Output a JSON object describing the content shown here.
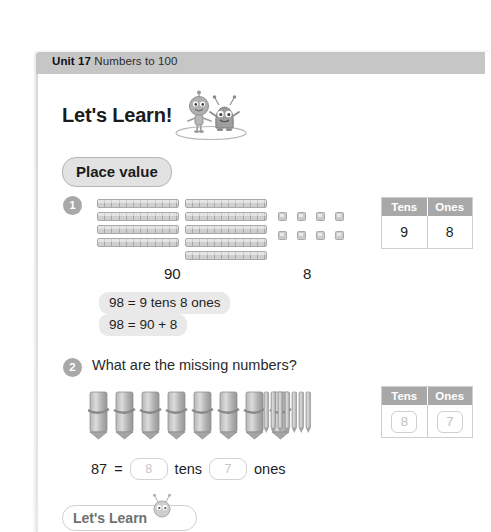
{
  "header": {
    "unit_label": "Unit 17",
    "unit_title": "Numbers to 100"
  },
  "lets_learn": {
    "title": "Let's Learn!",
    "mascot_left": "robot-character-icon",
    "mascot_right": "alien-character-icon"
  },
  "topic_pill": {
    "label": "Place value"
  },
  "questions": [
    {
      "number": "1",
      "prompt": "",
      "manipulative": "base-ten-blocks",
      "tens_rods_left_column": 4,
      "tens_rods_right_column": 5,
      "tens_rods_total": 9,
      "unit_cubes": 8,
      "label_tens_group": "90",
      "label_ones_group": "8",
      "table": {
        "headers": [
          "Tens",
          "Ones"
        ],
        "values": [
          "9",
          "8"
        ],
        "filled": true
      },
      "equations": [
        "98 = 9 tens 8 ones",
        "98 = 90 + 8"
      ]
    },
    {
      "number": "2",
      "prompt": "What are the missing numbers?",
      "manipulative": "pencil-bundles",
      "pencil_bundles": 8,
      "loose_pencils": 7,
      "table": {
        "headers": [
          "Tens",
          "Ones"
        ],
        "values": [
          "8",
          "7"
        ],
        "filled": false
      },
      "equation": {
        "number": "87",
        "equals": "=",
        "tens_answer": "8",
        "tens_word": "tens",
        "ones_answer": "7",
        "ones_word": "ones"
      }
    }
  ],
  "bottom_section": {
    "label": "Let's Learn",
    "bug_icon": "bug-character-icon"
  },
  "colors": {
    "band_gray": "#c6c6c6",
    "badge_gray": "#a8a8a8",
    "table_header_gray": "#a8a8a8",
    "pill_gray": "#e2e2e2",
    "equation_pill_gray": "#e9e9e9",
    "block_gray": "#cfcfcf",
    "text_dark": "#1d1d1d"
  }
}
